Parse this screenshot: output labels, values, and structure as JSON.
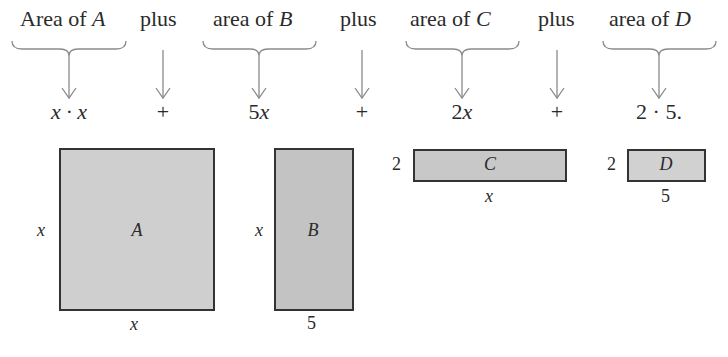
{
  "headers": {
    "area_a": {
      "prefix": "Area of ",
      "var": "A"
    },
    "plus1": "plus",
    "area_b": {
      "prefix": "area of ",
      "var": "B"
    },
    "plus2": "plus",
    "area_c": {
      "prefix": "area of ",
      "var": "C"
    },
    "plus3": "plus",
    "area_d": {
      "prefix": "area of ",
      "var": "D"
    }
  },
  "expressions": {
    "a": "x · x",
    "plus1": "+",
    "b_num": "5",
    "b_var": "x",
    "plus2": "+",
    "c_num": "2",
    "c_var": "x",
    "plus3": "+",
    "d": "2 · 5."
  },
  "shapes": {
    "A": {
      "label": "A",
      "side_label": "x",
      "bottom_label": "x",
      "fill": "#cfcfcf"
    },
    "B": {
      "label": "B",
      "side_label": "x",
      "bottom_label": "5",
      "fill": "#c3c3c3"
    },
    "C": {
      "label": "C",
      "side_label": "2",
      "bottom_label": "x",
      "fill": "#c8c8c8"
    },
    "D": {
      "label": "D",
      "side_label": "2",
      "bottom_label": "5",
      "fill": "#d1d1d1"
    }
  },
  "colors": {
    "stroke": "#333333",
    "arrow": "#8a8a8a",
    "text": "#2a2a2a"
  }
}
